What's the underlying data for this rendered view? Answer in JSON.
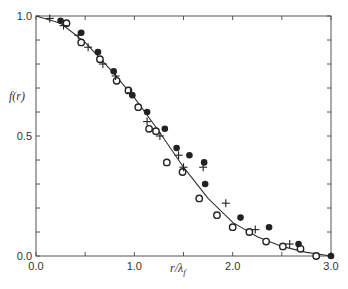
{
  "chart_data": {
    "type": "scatter",
    "title": "",
    "xlabel": "r/λ_f",
    "ylabel": "f(r)",
    "xlim": [
      0.0,
      3.0
    ],
    "ylim": [
      0.0,
      1.0
    ],
    "x_ticks": [
      "0.0",
      "1.0",
      "2.0",
      "3.0"
    ],
    "y_ticks": [
      "0.0",
      "0.5",
      "1.0"
    ],
    "grid": false,
    "legend": "none",
    "series": [
      {
        "name": "open circles",
        "marker": "open-circle",
        "points": [
          [
            0.31,
            0.97
          ],
          [
            0.46,
            0.89
          ],
          [
            0.65,
            0.82
          ],
          [
            0.82,
            0.73
          ],
          [
            0.94,
            0.69
          ],
          [
            1.04,
            0.62
          ],
          [
            1.15,
            0.53
          ],
          [
            1.22,
            0.52
          ],
          [
            1.33,
            0.39
          ],
          [
            1.49,
            0.35
          ],
          [
            1.66,
            0.24
          ],
          [
            1.84,
            0.17
          ],
          [
            2.0,
            0.12
          ],
          [
            2.17,
            0.1
          ],
          [
            2.34,
            0.06
          ],
          [
            2.51,
            0.04
          ],
          [
            2.69,
            0.03
          ],
          [
            2.85,
            0.0
          ]
        ]
      },
      {
        "name": "filled circles",
        "marker": "filled-circle",
        "points": [
          [
            0.25,
            0.98
          ],
          [
            0.46,
            0.93
          ],
          [
            0.63,
            0.85
          ],
          [
            0.79,
            0.77
          ],
          [
            0.98,
            0.67
          ],
          [
            1.13,
            0.6
          ],
          [
            1.31,
            0.53
          ],
          [
            1.43,
            0.45
          ],
          [
            1.56,
            0.42
          ],
          [
            1.71,
            0.39
          ],
          [
            1.72,
            0.3
          ],
          [
            2.08,
            0.16
          ],
          [
            2.37,
            0.12
          ],
          [
            2.67,
            0.05
          ],
          [
            3.0,
            0.0
          ]
        ]
      },
      {
        "name": "crosses",
        "marker": "plus",
        "points": [
          [
            0.14,
            0.99
          ],
          [
            0.28,
            0.96
          ],
          [
            0.43,
            0.92
          ],
          [
            0.53,
            0.87
          ],
          [
            0.68,
            0.8
          ],
          [
            0.81,
            0.75
          ],
          [
            0.96,
            0.68
          ],
          [
            1.13,
            0.56
          ],
          [
            1.26,
            0.5
          ],
          [
            1.45,
            0.42
          ],
          [
            1.5,
            0.37
          ],
          [
            1.7,
            0.37
          ],
          [
            1.93,
            0.22
          ],
          [
            2.23,
            0.11
          ],
          [
            2.58,
            0.05
          ]
        ]
      }
    ],
    "fit_curve": {
      "name": "solid line",
      "x": [
        0.0,
        0.25,
        0.5,
        0.75,
        1.0,
        1.25,
        1.5,
        1.75,
        2.0,
        2.25,
        2.5,
        2.75,
        3.0
      ],
      "y": [
        1.0,
        0.97,
        0.89,
        0.78,
        0.66,
        0.52,
        0.37,
        0.24,
        0.14,
        0.08,
        0.04,
        0.015,
        0.0
      ]
    }
  },
  "axes": {
    "x_label": "r/λ",
    "x_label_sub": "f",
    "y_label": "f(r)"
  }
}
